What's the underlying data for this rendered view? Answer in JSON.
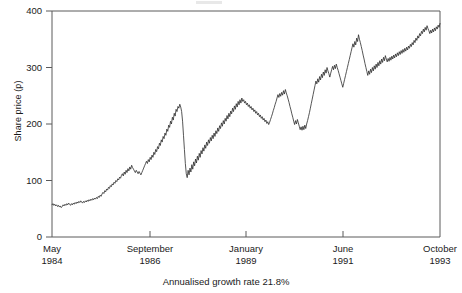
{
  "chart_data": {
    "type": "line",
    "title": "",
    "subtitle": "",
    "xlabel": "",
    "ylabel": "Share price (p)",
    "caption": "Annualised growth rate 21.8%",
    "ylim": [
      0,
      400
    ],
    "yticks": [
      0,
      100,
      200,
      300,
      400
    ],
    "ytick_labels": [
      "0",
      "100",
      "200",
      "300",
      "400"
    ],
    "grid": false,
    "legend": null,
    "xtick_labels": [
      {
        "month": "May",
        "year": "1984"
      },
      {
        "month": "September",
        "year": "1986"
      },
      {
        "month": "January",
        "year": "1989"
      },
      {
        "month": "June",
        "year": "1991"
      },
      {
        "month": "October",
        "year": "1993"
      }
    ],
    "xtick_positions": [
      0,
      0.2526,
      0.5,
      0.75,
      1
    ],
    "line_color": "#2b2b2b",
    "series": [
      {
        "name": "Share price",
        "values": [
          57,
          59,
          56,
          58,
          55,
          57,
          54,
          56,
          53,
          55,
          52,
          54,
          57,
          55,
          58,
          56,
          59,
          57,
          60,
          58,
          56,
          59,
          57,
          60,
          58,
          61,
          59,
          62,
          60,
          63,
          61,
          64,
          62,
          60,
          63,
          61,
          64,
          62,
          65,
          63,
          66,
          64,
          67,
          65,
          68,
          66,
          69,
          67,
          70,
          68,
          72,
          70,
          74,
          72,
          76,
          79,
          77,
          82,
          80,
          85,
          83,
          88,
          86,
          91,
          89,
          94,
          92,
          97,
          95,
          100,
          98,
          103,
          101,
          106,
          104,
          109,
          112,
          108,
          115,
          111,
          118,
          114,
          121,
          117,
          124,
          120,
          127,
          123,
          120,
          117,
          114,
          118,
          115,
          112,
          116,
          113,
          110,
          114,
          118,
          122,
          126,
          130,
          134,
          130,
          137,
          133,
          141,
          137,
          145,
          141,
          150,
          146,
          155,
          151,
          160,
          156,
          166,
          162,
          172,
          168,
          178,
          174,
          184,
          180,
          191,
          187,
          198,
          194,
          205,
          200,
          212,
          207,
          219,
          214,
          226,
          222,
          231,
          228,
          235,
          230,
          222,
          205,
          180,
          155,
          130,
          112,
          105,
          118,
          110,
          122,
          115,
          128,
          120,
          133,
          126,
          138,
          131,
          143,
          136,
          148,
          141,
          153,
          147,
          158,
          152,
          163,
          157,
          168,
          162,
          172,
          166,
          176,
          170,
          180,
          174,
          184,
          178,
          188,
          183,
          193,
          187,
          197,
          192,
          202,
          196,
          206,
          200,
          210,
          205,
          215,
          209,
          219,
          213,
          223,
          218,
          228,
          222,
          232,
          226,
          236,
          230,
          240,
          234,
          243,
          237,
          246,
          240,
          243,
          237,
          240,
          234,
          237,
          231,
          234,
          228,
          231,
          225,
          228,
          222,
          225,
          219,
          222,
          216,
          219,
          213,
          216,
          210,
          213,
          207,
          210,
          204,
          207,
          201,
          204,
          199,
          203,
          208,
          213,
          218,
          224,
          229,
          235,
          240,
          246,
          252,
          247,
          254,
          249,
          256,
          251,
          259,
          253,
          261,
          255,
          250,
          244,
          238,
          231,
          225,
          218,
          212,
          205,
          199,
          206,
          200,
          208,
          202,
          196,
          190,
          195,
          189,
          196,
          190,
          198,
          192,
          200,
          206,
          213,
          220,
          228,
          236,
          244,
          252,
          260,
          268,
          276,
          271,
          280,
          274,
          284,
          278,
          288,
          282,
          292,
          286,
          296,
          290,
          300,
          294,
          289,
          283,
          290,
          296,
          302,
          296,
          304,
          298,
          306,
          300,
          295,
          289,
          283,
          277,
          271,
          265,
          272,
          279,
          286,
          293,
          300,
          307,
          314,
          321,
          328,
          335,
          342,
          336,
          346,
          340,
          352,
          346,
          358,
          350,
          344,
          337,
          330,
          322,
          315,
          307,
          300,
          293,
          286,
          294,
          288,
          297,
          291,
          300,
          294,
          303,
          297,
          306,
          300,
          309,
          303,
          312,
          306,
          315,
          309,
          318,
          312,
          321,
          315,
          310,
          316,
          311,
          318,
          313,
          320,
          315,
          322,
          317,
          324,
          319,
          326,
          321,
          328,
          323,
          330,
          325,
          332,
          327,
          334,
          329,
          336,
          331,
          338,
          334,
          341,
          337,
          344,
          340,
          348,
          344,
          352,
          348,
          356,
          352,
          360,
          356,
          364,
          360,
          368,
          363,
          371,
          366,
          374,
          369,
          365,
          360,
          366,
          361,
          368,
          363,
          370,
          365,
          372,
          368,
          375,
          371,
          378
        ]
      }
    ]
  }
}
